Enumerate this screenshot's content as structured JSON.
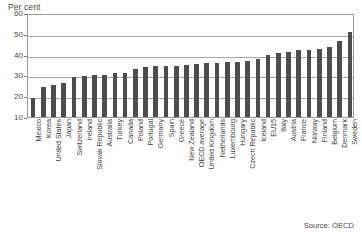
{
  "figure": {
    "axis_title": "Per cent",
    "source_note": "Source: OECD",
    "bar_color": "#4d4d4d",
    "grid_color": "#a8a8a8",
    "frame_color": "#9a9a9a",
    "background": "#ffffff"
  },
  "chart_data": {
    "type": "bar",
    "title": "",
    "subtitle": "",
    "xlabel": "",
    "ylabel": "Per cent",
    "ylim": [
      10,
      60
    ],
    "yticks": [
      10,
      20,
      30,
      40,
      50,
      60
    ],
    "ytick_labels": [
      "10",
      "20",
      "30",
      "40",
      "50",
      "60"
    ],
    "grid": true,
    "legend": false,
    "legend_position": "none",
    "orientation": "vertical",
    "sorted": "ascending",
    "annotations": [
      "Source: OECD"
    ],
    "categories": [
      "Mexico",
      "Korea",
      "United States",
      "Japan",
      "Switzerland",
      "Ireland",
      "Slovak Republic",
      "Australia",
      "Turkey",
      "Canada",
      "Poland",
      "Portugal",
      "Germany",
      "Spain",
      "Greece",
      "New Zealand",
      "OECD average",
      "United Kingdom",
      "Netherlands",
      "Luxembourg",
      "Hungary",
      "Czech Republic",
      "Iceland",
      "EU15",
      "Italy",
      "Austria",
      "France",
      "Norway",
      "Finland",
      "Belgium",
      "Denmark",
      "Sweden"
    ],
    "values": [
      19.0,
      24.3,
      25.4,
      26.4,
      29.0,
      29.8,
      30.0,
      30.1,
      31.1,
      31.0,
      33.3,
      34.0,
      34.4,
      34.4,
      34.7,
      34.8,
      35.5,
      35.8,
      36.0,
      36.3,
      36.5,
      37.0,
      38.0,
      39.7,
      40.7,
      41.2,
      42.2,
      42.4,
      42.7,
      43.5,
      46.4,
      50.8
    ]
  }
}
